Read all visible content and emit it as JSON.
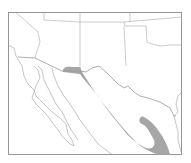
{
  "map": {
    "type": "species range map",
    "region": "Southwestern United States and Mexico",
    "colors": {
      "background": "#ffffff",
      "range_fill": "#a6a6a6",
      "boundary_lines": "#a0a0a0",
      "frame": "#8c8c8c"
    },
    "layers": [
      {
        "id": "frame",
        "label": "map frame"
      },
      {
        "id": "state-boundaries",
        "label": "state boundaries"
      },
      {
        "id": "national-border",
        "label": "US-Mexico border"
      },
      {
        "id": "coastlines",
        "label": "coastlines"
      },
      {
        "id": "range",
        "label": "shaded range"
      }
    ]
  }
}
